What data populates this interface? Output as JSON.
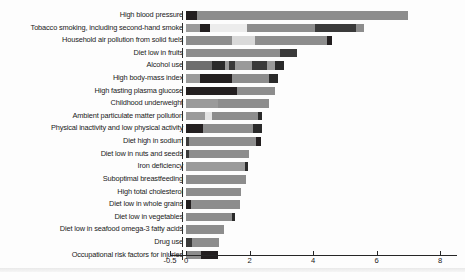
{
  "chart_data": {
    "type": "bar",
    "orientation": "horizontal",
    "stacked": true,
    "title": "",
    "xlabel": "",
    "ylabel": "",
    "xlim": [
      -0.5,
      8.5
    ],
    "grid": false,
    "legend": "none",
    "xticks": [
      {
        "value": -0.5,
        "label": "-0.5",
        "x": 170
      },
      {
        "value": 0,
        "label": "0",
        "x": 186
      },
      {
        "value": 2,
        "label": "2",
        "x": 249.5
      },
      {
        "value": 4,
        "label": "4",
        "x": 313
      },
      {
        "value": 6,
        "label": "6",
        "x": 376.5
      },
      {
        "value": 8,
        "label": "8",
        "x": 440
      }
    ],
    "px_per_unit": 31.75,
    "x_zero_px": 186,
    "categories": [
      "High blood pressure",
      "Tobacco smoking, including second-hand smoke",
      "Household air pollution from solid fuels",
      "Diet low in fruits",
      "Alcohol use",
      "High body-mass index",
      "High fasting plasma glucose",
      "Childhood underweight",
      "Ambient particulate matter pollution",
      "Physical inactivity and low physical activity",
      "Diet high in sodium",
      "Diet low in nuts and seeds",
      "Iron deficiency",
      "Suboptimal breastfeeding",
      "High total cholesterol",
      "Diet low in whole grains",
      "Diet low in vegetables",
      "Diet low in seafood omega-3 fatty acids",
      "Drug use",
      "Occupational risk factors for injuries"
    ],
    "totals": [
      7.0,
      5.6,
      4.6,
      3.5,
      3.1,
      2.9,
      2.8,
      2.6,
      2.4,
      2.4,
      2.35,
      2.0,
      1.95,
      1.9,
      1.72,
      1.7,
      1.55,
      1.2,
      1.05,
      1.0
    ],
    "rows": [
      {
        "category": "High blood pressure",
        "total": 7.0,
        "segments": [
          {
            "value": 0.35,
            "shade": "#231f20"
          },
          {
            "value": 6.65,
            "shade": "#8d8d8d"
          }
        ]
      },
      {
        "category": "Tobacco smoking, including second-hand smoke",
        "total": 5.6,
        "segments": [
          {
            "value": 0.45,
            "shade": "#9a9a9a"
          },
          {
            "value": 0.32,
            "shade": "#231f20"
          },
          {
            "value": 1.15,
            "shade": "#ececec"
          },
          {
            "value": 2.15,
            "shade": "#8d8d8d"
          },
          {
            "value": 1.28,
            "shade": "#3a3a3a"
          },
          {
            "value": 0.25,
            "shade": "#8d8d8d"
          }
        ]
      },
      {
        "category": "Household air pollution from solid fuels",
        "total": 4.6,
        "segments": [
          {
            "value": 1.45,
            "shade": "#8d8d8d"
          },
          {
            "value": 0.72,
            "shade": "#d9d9d9"
          },
          {
            "value": 2.28,
            "shade": "#8d8d8d"
          },
          {
            "value": 0.15,
            "shade": "#231f20"
          }
        ]
      },
      {
        "category": "Diet low in fruits",
        "total": 3.5,
        "segments": [
          {
            "value": 2.95,
            "shade": "#8d8d8d"
          },
          {
            "value": 0.55,
            "shade": "#3a3a3a"
          }
        ]
      },
      {
        "category": "Alcohol use",
        "total": 3.1,
        "segments": [
          {
            "value": 0.82,
            "shade": "#6e6e6e"
          },
          {
            "value": 0.42,
            "shade": "#2a2a2a"
          },
          {
            "value": 0.1,
            "shade": "#9a9a9a"
          },
          {
            "value": 0.2,
            "shade": "#3a3a3a"
          },
          {
            "value": 0.55,
            "shade": "#9a9a9a"
          },
          {
            "value": 0.45,
            "shade": "#3a3a3a"
          },
          {
            "value": 0.28,
            "shade": "#9a9a9a"
          },
          {
            "value": 0.28,
            "shade": "#2a2a2a"
          }
        ]
      },
      {
        "category": "High body-mass index",
        "total": 2.9,
        "segments": [
          {
            "value": 0.45,
            "shade": "#9a9a9a"
          },
          {
            "value": 1.0,
            "shade": "#231f20"
          },
          {
            "value": 1.15,
            "shade": "#8d8d8d"
          },
          {
            "value": 0.3,
            "shade": "#2a2a2a"
          }
        ]
      },
      {
        "category": "High fasting plasma glucose",
        "total": 2.8,
        "segments": [
          {
            "value": 1.6,
            "shade": "#231f20"
          },
          {
            "value": 1.2,
            "shade": "#8d8d8d"
          }
        ]
      },
      {
        "category": "Childhood underweight",
        "total": 2.6,
        "segments": [
          {
            "value": 1.0,
            "shade": "#9a9a9a"
          },
          {
            "value": 1.6,
            "shade": "#8d8d8d"
          }
        ]
      },
      {
        "category": "Ambient particulate matter pollution",
        "total": 2.4,
        "segments": [
          {
            "value": 0.6,
            "shade": "#9a9a9a"
          },
          {
            "value": 0.22,
            "shade": "#e4e4e4"
          },
          {
            "value": 1.45,
            "shade": "#8d8d8d"
          },
          {
            "value": 0.13,
            "shade": "#2a2a2a"
          }
        ]
      },
      {
        "category": "Physical inactivity and low physical activity",
        "total": 2.4,
        "segments": [
          {
            "value": 0.55,
            "shade": "#231f20"
          },
          {
            "value": 1.55,
            "shade": "#8d8d8d"
          },
          {
            "value": 0.3,
            "shade": "#2a2a2a"
          }
        ]
      },
      {
        "category": "Diet high in sodium",
        "total": 2.35,
        "segments": [
          {
            "value": 0.1,
            "shade": "#3a3a3a"
          },
          {
            "value": 2.12,
            "shade": "#8d8d8d"
          },
          {
            "value": 0.13,
            "shade": "#231f20"
          }
        ]
      },
      {
        "category": "Diet low in nuts and seeds",
        "total": 2.0,
        "segments": [
          {
            "value": 0.08,
            "shade": "#3a3a3a"
          },
          {
            "value": 1.92,
            "shade": "#8d8d8d"
          }
        ]
      },
      {
        "category": "Iron deficiency",
        "total": 1.95,
        "segments": [
          {
            "value": 1.85,
            "shade": "#9a9a9a"
          },
          {
            "value": 0.1,
            "shade": "#2a2a2a"
          }
        ]
      },
      {
        "category": "Suboptimal breastfeeding",
        "total": 1.9,
        "segments": [
          {
            "value": 1.9,
            "shade": "#8d8d8d"
          }
        ]
      },
      {
        "category": "High total cholesterol",
        "total": 1.72,
        "segments": [
          {
            "value": 1.72,
            "shade": "#8d8d8d"
          }
        ]
      },
      {
        "category": "Diet low in whole grains",
        "total": 1.7,
        "segments": [
          {
            "value": 0.17,
            "shade": "#231f20"
          },
          {
            "value": 1.53,
            "shade": "#8d8d8d"
          }
        ]
      },
      {
        "category": "Diet low in vegetables",
        "total": 1.55,
        "segments": [
          {
            "value": 1.44,
            "shade": "#8d8d8d"
          },
          {
            "value": 0.11,
            "shade": "#2a2a2a"
          }
        ]
      },
      {
        "category": "Diet low in seafood omega-3 fatty acids",
        "total": 1.2,
        "segments": [
          {
            "value": 1.2,
            "shade": "#8d8d8d"
          }
        ]
      },
      {
        "category": "Drug use",
        "total": 1.05,
        "segments": [
          {
            "value": 0.2,
            "shade": "#3a3a3a"
          },
          {
            "value": 0.85,
            "shade": "#8d8d8d"
          }
        ]
      },
      {
        "category": "Occupational risk factors for injuries",
        "total": 1.0,
        "segments": [
          {
            "value": 0.48,
            "shade": "#8d8d8d"
          },
          {
            "value": 0.52,
            "shade": "#231f20"
          }
        ]
      }
    ]
  }
}
